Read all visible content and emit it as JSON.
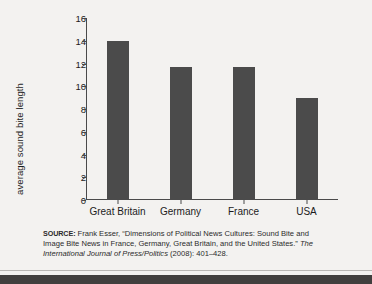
{
  "chart_data": {
    "type": "bar",
    "title": "",
    "xlabel": "",
    "ylabel": "average sound bite length",
    "categories": [
      "Great Britain",
      "Germany",
      "France",
      "USA"
    ],
    "values": [
      14.0,
      11.7,
      11.7,
      9.0
    ],
    "ylim": [
      0,
      16
    ],
    "yticks": [
      0,
      2,
      4,
      6,
      8,
      10,
      12,
      14,
      16
    ],
    "ytick_labels": [
      "0",
      "2",
      "4",
      "6",
      "8",
      "10",
      "12",
      "14",
      "16"
    ],
    "grid": false,
    "legend": "none",
    "bar_color": "#4b4b4b",
    "axis_color": "#4a4a4a",
    "background_color": "#f3f2f0"
  },
  "source": {
    "label": "SOURCE:",
    "line1_rest": " Frank Esser, “Dimensions of Political News Cultures: Sound Bite",
    "line2": "and Image Bite News in France, Germany, Great Britain, and the United",
    "line3_start": "States.” ",
    "line3_italic": "The International Journal of Press/Politics",
    "line3_end": " (2008): 401–428."
  }
}
